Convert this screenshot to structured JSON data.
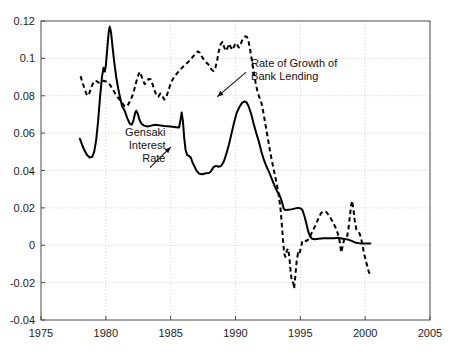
{
  "chart_data": {
    "type": "line",
    "title": "",
    "subtitle": "",
    "xlabel": "",
    "ylabel": "",
    "xlim": [
      1975,
      2005
    ],
    "ylim": [
      -0.04,
      0.12
    ],
    "grid": true,
    "legend_position": "inline-annotations",
    "xticks": [
      1975,
      1980,
      1985,
      1990,
      1995,
      2000,
      2005
    ],
    "xtick_labels": [
      "1975",
      "1980",
      "1985",
      "1990",
      "1995",
      "2000",
      "2005"
    ],
    "yticks": [
      -0.04,
      -0.02,
      0,
      0.02,
      0.04,
      0.06,
      0.08,
      0.1,
      0.12
    ],
    "ytick_labels": [
      "-0.04",
      "-0.02",
      "0",
      "0.02",
      "0.04",
      "0.06",
      "0.08",
      "0.1",
      "0.12"
    ],
    "annotations": [
      {
        "name": "bank-lending-annotation",
        "lines": [
          "Rate of Growth of",
          "Bank Lending"
        ],
        "text_x": 1991.2,
        "text_y": 0.0955,
        "align": "left",
        "leader_from": [
          1990.8,
          0.0925
        ],
        "leader_to": [
          1988.6,
          0.0795
        ]
      },
      {
        "name": "gensaki-annotation",
        "lines": [
          "Gensaki",
          "Interest",
          "Rate"
        ],
        "text_x": 1984.6,
        "text_y": 0.0585,
        "align": "right",
        "leader_from": [
          1983.4,
          0.0415
        ],
        "leader_to": [
          1985.0,
          0.0525
        ]
      }
    ],
    "series": [
      {
        "name": "Gensaki Interest Rate",
        "style": "solid",
        "color": "#000000",
        "points": [
          [
            1978.0,
            0.057
          ],
          [
            1978.18,
            0.0535
          ],
          [
            1978.35,
            0.0508
          ],
          [
            1978.55,
            0.0483
          ],
          [
            1978.75,
            0.047
          ],
          [
            1978.95,
            0.0473
          ],
          [
            1979.1,
            0.05
          ],
          [
            1979.25,
            0.056
          ],
          [
            1979.4,
            0.066
          ],
          [
            1979.55,
            0.079
          ],
          [
            1979.7,
            0.09
          ],
          [
            1979.82,
            0.095
          ],
          [
            1979.92,
            0.093
          ],
          [
            1980.0,
            0.096
          ],
          [
            1980.12,
            0.106
          ],
          [
            1980.22,
            0.114
          ],
          [
            1980.3,
            0.117
          ],
          [
            1980.4,
            0.114
          ],
          [
            1980.52,
            0.106
          ],
          [
            1980.65,
            0.098
          ],
          [
            1980.8,
            0.09
          ],
          [
            1980.95,
            0.084
          ],
          [
            1981.1,
            0.079
          ],
          [
            1981.25,
            0.0745
          ],
          [
            1981.45,
            0.072
          ],
          [
            1981.65,
            0.068
          ],
          [
            1981.85,
            0.065
          ],
          [
            1982.0,
            0.0645
          ],
          [
            1982.12,
            0.0665
          ],
          [
            1982.25,
            0.0705
          ],
          [
            1982.35,
            0.072
          ],
          [
            1982.48,
            0.07
          ],
          [
            1982.6,
            0.067
          ],
          [
            1982.75,
            0.065
          ],
          [
            1982.95,
            0.064
          ],
          [
            1983.2,
            0.0635
          ],
          [
            1983.5,
            0.064
          ],
          [
            1983.8,
            0.0645
          ],
          [
            1984.1,
            0.0642
          ],
          [
            1984.5,
            0.0638
          ],
          [
            1985.0,
            0.0635
          ],
          [
            1985.4,
            0.0632
          ],
          [
            1985.65,
            0.063
          ],
          [
            1985.78,
            0.068
          ],
          [
            1985.85,
            0.071
          ],
          [
            1985.95,
            0.066
          ],
          [
            1986.05,
            0.057
          ],
          [
            1986.15,
            0.051
          ],
          [
            1986.28,
            0.0482
          ],
          [
            1986.42,
            0.0478
          ],
          [
            1986.55,
            0.047
          ],
          [
            1986.7,
            0.044
          ],
          [
            1986.85,
            0.042
          ],
          [
            1987.0,
            0.0398
          ],
          [
            1987.2,
            0.0383
          ],
          [
            1987.45,
            0.038
          ],
          [
            1987.7,
            0.0385
          ],
          [
            1987.95,
            0.0387
          ],
          [
            1988.1,
            0.0395
          ],
          [
            1988.3,
            0.0418
          ],
          [
            1988.5,
            0.0425
          ],
          [
            1988.7,
            0.042
          ],
          [
            1988.9,
            0.0425
          ],
          [
            1989.1,
            0.0448
          ],
          [
            1989.3,
            0.049
          ],
          [
            1989.5,
            0.054
          ],
          [
            1989.7,
            0.06
          ],
          [
            1989.9,
            0.066
          ],
          [
            1990.1,
            0.071
          ],
          [
            1990.3,
            0.074
          ],
          [
            1990.5,
            0.0762
          ],
          [
            1990.7,
            0.077
          ],
          [
            1990.85,
            0.0765
          ],
          [
            1991.0,
            0.0745
          ],
          [
            1991.2,
            0.0705
          ],
          [
            1991.4,
            0.065
          ],
          [
            1991.6,
            0.06
          ],
          [
            1991.8,
            0.0555
          ],
          [
            1992.0,
            0.05
          ],
          [
            1992.2,
            0.0455
          ],
          [
            1992.4,
            0.042
          ],
          [
            1992.6,
            0.039
          ],
          [
            1992.8,
            0.0355
          ],
          [
            1993.0,
            0.032
          ],
          [
            1993.2,
            0.029
          ],
          [
            1993.35,
            0.0275
          ],
          [
            1993.5,
            0.025
          ],
          [
            1993.62,
            0.0222
          ],
          [
            1993.72,
            0.0195
          ],
          [
            1993.85,
            0.0188
          ],
          [
            1994.05,
            0.019
          ],
          [
            1994.3,
            0.0192
          ],
          [
            1994.55,
            0.0196
          ],
          [
            1994.8,
            0.02
          ],
          [
            1995.0,
            0.0198
          ],
          [
            1995.15,
            0.019
          ],
          [
            1995.3,
            0.016
          ],
          [
            1995.45,
            0.012
          ],
          [
            1995.6,
            0.0075
          ],
          [
            1995.75,
            0.0048
          ],
          [
            1995.9,
            0.0035
          ],
          [
            1996.1,
            0.0032
          ],
          [
            1996.4,
            0.0035
          ],
          [
            1996.8,
            0.0037
          ],
          [
            1997.2,
            0.0037
          ],
          [
            1997.6,
            0.0038
          ],
          [
            1997.9,
            0.004
          ],
          [
            1998.1,
            0.0038
          ],
          [
            1998.4,
            0.0034
          ],
          [
            1998.7,
            0.003
          ],
          [
            1999.0,
            0.0022
          ],
          [
            1999.3,
            0.0013
          ],
          [
            1999.6,
            0.001
          ],
          [
            2000.0,
            0.001
          ],
          [
            2000.4,
            0.001
          ]
        ]
      },
      {
        "name": "Rate of Growth of Bank Lending",
        "style": "dashed",
        "color": "#000000",
        "points": [
          [
            1978.05,
            0.0905
          ],
          [
            1978.2,
            0.087
          ],
          [
            1978.35,
            0.084
          ],
          [
            1978.5,
            0.081
          ],
          [
            1978.62,
            0.08
          ],
          [
            1978.75,
            0.0818
          ],
          [
            1978.88,
            0.0845
          ],
          [
            1979.0,
            0.0865
          ],
          [
            1979.15,
            0.088
          ],
          [
            1979.3,
            0.0878
          ],
          [
            1979.45,
            0.087
          ],
          [
            1979.62,
            0.0872
          ],
          [
            1979.8,
            0.088
          ],
          [
            1979.95,
            0.0878
          ],
          [
            1980.1,
            0.0872
          ],
          [
            1980.25,
            0.0865
          ],
          [
            1980.4,
            0.085
          ],
          [
            1980.55,
            0.0832
          ],
          [
            1980.72,
            0.0812
          ],
          [
            1980.88,
            0.0795
          ],
          [
            1981.05,
            0.078
          ],
          [
            1981.25,
            0.0762
          ],
          [
            1981.45,
            0.0745
          ],
          [
            1981.62,
            0.0742
          ],
          [
            1981.8,
            0.0762
          ],
          [
            1181.95,
            0.079
          ],
          [
            1982.05,
            0.08
          ],
          [
            1982.2,
            0.0835
          ],
          [
            1982.35,
            0.0875
          ],
          [
            1982.5,
            0.091
          ],
          [
            1982.62,
            0.0928
          ],
          [
            1982.75,
            0.0905
          ],
          [
            1982.88,
            0.088
          ],
          [
            1983.0,
            0.0862
          ],
          [
            1983.15,
            0.0875
          ],
          [
            1983.3,
            0.089
          ],
          [
            1983.45,
            0.0888
          ],
          [
            1983.6,
            0.0862
          ],
          [
            1983.75,
            0.083
          ],
          [
            1983.9,
            0.0802
          ],
          [
            1984.05,
            0.0795
          ],
          [
            1984.2,
            0.0812
          ],
          [
            1984.35,
            0.08
          ],
          [
            1984.5,
            0.078
          ],
          [
            1984.65,
            0.079
          ],
          [
            1984.8,
            0.0822
          ],
          [
            1984.95,
            0.0855
          ],
          [
            1985.1,
            0.088
          ],
          [
            1985.25,
            0.0898
          ],
          [
            1985.4,
            0.0912
          ],
          [
            1985.55,
            0.0925
          ],
          [
            1985.75,
            0.094
          ],
          [
            1985.95,
            0.0955
          ],
          [
            1986.15,
            0.0968
          ],
          [
            1986.35,
            0.098
          ],
          [
            1986.55,
            0.0995
          ],
          [
            1986.75,
            0.1012
          ],
          [
            1986.95,
            0.1025
          ],
          [
            1987.1,
            0.1038
          ],
          [
            1987.25,
            0.103
          ],
          [
            1987.4,
            0.101
          ],
          [
            1987.55,
            0.0995
          ],
          [
            1987.7,
            0.098
          ],
          [
            1987.85,
            0.0972
          ],
          [
            1988.0,
            0.096
          ],
          [
            1988.15,
            0.094
          ],
          [
            1988.3,
            0.0932
          ],
          [
            1988.45,
            0.095
          ],
          [
            1988.58,
            0.0988
          ],
          [
            1988.7,
            0.1035
          ],
          [
            1988.85,
            0.1075
          ],
          [
            1989.0,
            0.1088
          ],
          [
            1989.12,
            0.1062
          ],
          [
            1989.25,
            0.104
          ],
          [
            1989.38,
            0.1055
          ],
          [
            1989.5,
            0.1078
          ],
          [
            1989.62,
            0.1062
          ],
          [
            1989.75,
            0.1045
          ],
          [
            1989.88,
            0.1062
          ],
          [
            1990.0,
            0.1082
          ],
          [
            1990.12,
            0.1075
          ],
          [
            1990.25,
            0.1058
          ],
          [
            1990.38,
            0.1072
          ],
          [
            1990.5,
            0.1095
          ],
          [
            1990.62,
            0.1108
          ],
          [
            1990.75,
            0.1118
          ],
          [
            1990.88,
            0.1115
          ],
          [
            1991.0,
            0.1095
          ],
          [
            1991.12,
            0.105
          ],
          [
            1991.25,
            0.0995
          ],
          [
            1991.4,
            0.093
          ],
          [
            1991.55,
            0.087
          ],
          [
            1991.7,
            0.082
          ],
          [
            1991.85,
            0.079
          ],
          [
            1992.0,
            0.0762
          ],
          [
            1992.15,
            0.071
          ],
          [
            1992.3,
            0.065
          ],
          [
            1992.45,
            0.059
          ],
          [
            1992.6,
            0.053
          ],
          [
            1992.75,
            0.0472
          ],
          [
            1992.9,
            0.042
          ],
          [
            1993.05,
            0.0372
          ],
          [
            1993.2,
            0.0322
          ],
          [
            1993.32,
            0.0272
          ],
          [
            1993.45,
            0.021
          ],
          [
            1993.55,
            0.013
          ],
          [
            1993.65,
            0.004
          ],
          [
            1993.75,
            -0.0045
          ],
          [
            1993.85,
            -0.0062
          ],
          [
            1993.95,
            -0.003
          ],
          [
            1994.05,
            -0.0018
          ],
          [
            1994.15,
            -0.006
          ],
          [
            1994.25,
            -0.014
          ],
          [
            1994.35,
            -0.0197
          ],
          [
            1994.45,
            -0.02
          ],
          [
            1994.52,
            -0.0232
          ],
          [
            1994.62,
            -0.016
          ],
          [
            1994.72,
            -0.0085
          ],
          [
            1994.82,
            -0.0042
          ],
          [
            1994.92,
            -0.005
          ],
          [
            1995.02,
            -0.0022
          ],
          [
            1995.15,
            0.002
          ],
          [
            1995.3,
            0.0028
          ],
          [
            1995.45,
            0.0022
          ],
          [
            1995.6,
            0.003
          ],
          [
            1995.8,
            0.0055
          ],
          [
            1996.0,
            0.0082
          ],
          [
            1996.2,
            0.0112
          ],
          [
            1996.4,
            0.0145
          ],
          [
            1996.6,
            0.0172
          ],
          [
            1996.8,
            0.0182
          ],
          [
            1997.0,
            0.0178
          ],
          [
            1997.2,
            0.016
          ],
          [
            1997.4,
            0.0138
          ],
          [
            1997.6,
            0.0112
          ],
          [
            1997.8,
            0.0082
          ],
          [
            1997.95,
            0.0048
          ],
          [
            1998.05,
            0.0015
          ],
          [
            1998.15,
            -0.0038
          ],
          [
            1998.25,
            -0.001
          ],
          [
            1998.38,
            0.0032
          ],
          [
            1998.5,
            0.0045
          ],
          [
            1998.62,
            0.005
          ],
          [
            1998.72,
            0.0092
          ],
          [
            1998.82,
            0.0155
          ],
          [
            1998.92,
            0.0215
          ],
          [
            1999.0,
            0.0238
          ],
          [
            1999.1,
            0.019
          ],
          [
            1999.2,
            0.013
          ],
          [
            1999.32,
            0.0085
          ],
          [
            1999.45,
            0.0072
          ],
          [
            1999.58,
            0.0062
          ],
          [
            1999.7,
            0.0032
          ],
          [
            1999.82,
            -0.001
          ],
          [
            1999.95,
            -0.0055
          ],
          [
            2000.1,
            -0.0095
          ],
          [
            2000.25,
            -0.0135
          ],
          [
            2000.4,
            -0.0168
          ]
        ]
      }
    ]
  }
}
